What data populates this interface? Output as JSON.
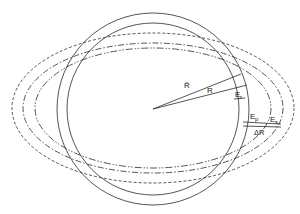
{
  "diagram": {
    "center": {
      "x": 153,
      "y": 109
    },
    "circles": [
      {
        "name": "outer-circle",
        "r": 96,
        "style": "solid"
      },
      {
        "name": "inner-circle",
        "r": 86,
        "style": "solid"
      }
    ],
    "ellipses": [
      {
        "name": "ellipse-dashed",
        "rx": 143,
        "ry": 76,
        "style": "dashed"
      },
      {
        "name": "ellipse-dash-dot",
        "rx": 131,
        "ry": 66,
        "style": "dash-dot"
      },
      {
        "name": "ellipse-dash-dot-dot",
        "rx": 119,
        "ry": 61,
        "style": "dash-dot-dot"
      }
    ],
    "labels": {
      "r_bar": "R̄",
      "r": "R",
      "e_r": "E",
      "e_r_sub": "r",
      "e_p": "E",
      "e_p_sub": "p",
      "e_s": "E",
      "e_s_sub": "s",
      "delta_r": "ΔR"
    },
    "colors": {
      "stroke": "#2a2a2a",
      "background": "#ffffff"
    }
  }
}
